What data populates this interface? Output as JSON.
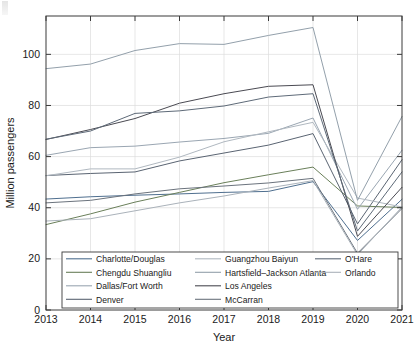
{
  "chart_data": {
    "type": "line",
    "title": "",
    "xlabel": "Year",
    "ylabel": "Million passengers",
    "x": [
      2013,
      2014,
      2015,
      2016,
      2017,
      2018,
      2019,
      2020,
      2021
    ],
    "xtick_labels": [
      "2013",
      "2014",
      "2015",
      "2016",
      "2017",
      "2018",
      "2019",
      "2020",
      "2021"
    ],
    "ytick_labels": [
      "0",
      "20",
      "40",
      "60",
      "80",
      "100"
    ],
    "yticks": [
      0,
      20,
      40,
      60,
      80,
      100
    ],
    "xlim": [
      2013,
      2021
    ],
    "ylim": [
      0,
      115
    ],
    "grid": true,
    "legend_position": "bottom-inside",
    "legend_columns": 3,
    "series": [
      {
        "name": "Charlotte/Douglas",
        "color": "#4f6f8f",
        "values": [
          43.4,
          44.3,
          44.9,
          45.4,
          46.0,
          46.4,
          50.2,
          27.2,
          43.3
        ]
      },
      {
        "name": "Chengdu Shuangliu",
        "color": "#6a7f5a",
        "values": [
          33.4,
          37.6,
          42.2,
          46.0,
          49.8,
          52.9,
          55.9,
          40.7,
          40.1
        ]
      },
      {
        "name": "Dallas/Fort Worth",
        "color": "#9aa6b2",
        "values": [
          60.5,
          63.5,
          64.1,
          65.7,
          67.1,
          69.1,
          75.1,
          39.4,
          62.5
        ]
      },
      {
        "name": "Denver",
        "color": "#5a6472",
        "values": [
          52.6,
          53.4,
          54.0,
          58.3,
          61.4,
          64.5,
          69.0,
          33.7,
          58.8
        ]
      },
      {
        "name": "Guangzhou Baiyun",
        "color": "#b0b8c0",
        "values": [
          52.5,
          55.2,
          55.2,
          59.8,
          65.8,
          69.7,
          73.4,
          43.8,
          40.3
        ]
      },
      {
        "name": "Hartsfield–Jackson Atlanta",
        "color": "#93a0ab",
        "values": [
          94.4,
          96.2,
          101.5,
          104.2,
          103.9,
          107.4,
          110.5,
          42.9,
          75.7
        ]
      },
      {
        "name": "Los Angeles",
        "color": "#4a4a52",
        "values": [
          66.7,
          70.6,
          74.9,
          80.9,
          84.6,
          87.5,
          88.1,
          28.8,
          48.0
        ]
      },
      {
        "name": "McCarran",
        "color": "#6b737d",
        "values": [
          41.9,
          42.9,
          45.4,
          47.4,
          48.5,
          49.7,
          51.5,
          22.2,
          39.7
        ]
      },
      {
        "name": "O'Hare",
        "color": "#5e6a78",
        "values": [
          66.8,
          70.0,
          76.9,
          77.9,
          79.8,
          83.3,
          84.6,
          30.9,
          54.0
        ]
      },
      {
        "name": "Orlando",
        "color": "#aab2ba",
        "values": [
          34.8,
          35.7,
          38.8,
          41.9,
          44.6,
          47.7,
          50.6,
          21.6,
          40.3
        ]
      }
    ]
  },
  "axes": {
    "x_title": "Year",
    "y_title": "Million passengers"
  }
}
